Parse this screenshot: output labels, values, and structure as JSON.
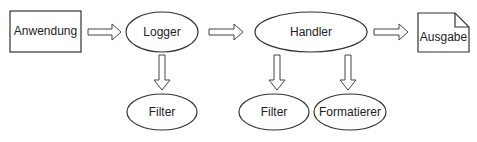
{
  "diagram": {
    "nodes": {
      "anwendung": {
        "label": "Anwendung",
        "shape": "rectangle"
      },
      "logger": {
        "label": "Logger",
        "shape": "ellipse"
      },
      "handler": {
        "label": "Handler",
        "shape": "ellipse"
      },
      "ausgabe": {
        "label": "Ausgabe",
        "shape": "document"
      },
      "logger_filter": {
        "label": "Filter",
        "shape": "ellipse"
      },
      "handler_filter": {
        "label": "Filter",
        "shape": "ellipse"
      },
      "formatierer": {
        "label": "Formatierer",
        "shape": "ellipse"
      }
    },
    "edges": [
      {
        "from": "Anwendung",
        "to": "Logger"
      },
      {
        "from": "Logger",
        "to": "Handler"
      },
      {
        "from": "Handler",
        "to": "Ausgabe"
      },
      {
        "from": "Logger",
        "to": "Filter"
      },
      {
        "from": "Handler",
        "to": "Filter"
      },
      {
        "from": "Handler",
        "to": "Formatierer"
      }
    ],
    "colors": {
      "stroke": "#333333",
      "background": "#ffffff",
      "text": "#222222"
    }
  }
}
